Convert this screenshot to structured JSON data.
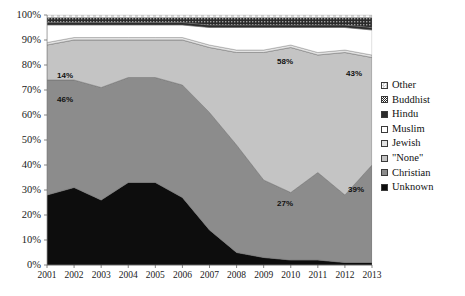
{
  "chart_data": {
    "type": "area",
    "title": "",
    "xlabel": "",
    "ylabel": "",
    "stacked": true,
    "percent": true,
    "grid": true,
    "legend_position": "right",
    "ylim": [
      0,
      100
    ],
    "yticks": [
      "0%",
      "10%",
      "20%",
      "30%",
      "40%",
      "50%",
      "60%",
      "70%",
      "80%",
      "90%",
      "100%"
    ],
    "ytick_values": [
      0,
      10,
      20,
      30,
      40,
      50,
      60,
      70,
      80,
      90,
      100
    ],
    "categories": [
      "2001",
      "2002",
      "2003",
      "2004",
      "2005",
      "2006",
      "2007",
      "2008",
      "2009",
      "2010",
      "2011",
      "2012",
      "2013"
    ],
    "series": [
      {
        "name": "Unknown",
        "color": "#0d0d0d",
        "pattern": "solid",
        "values": [
          28,
          31,
          26,
          33,
          33,
          27,
          14,
          5,
          3,
          2,
          2,
          1,
          1
        ]
      },
      {
        "name": "Christian",
        "color": "#8c8c8c",
        "pattern": "solid",
        "values": [
          46,
          43,
          45,
          42,
          42,
          45,
          47,
          43,
          31,
          27,
          35,
          27,
          39
        ]
      },
      {
        "name": "\"None\"",
        "color": "#c4c4c4",
        "pattern": "solid",
        "values": [
          14,
          16,
          19,
          15,
          15,
          18,
          26,
          37,
          51,
          58,
          47,
          57,
          43
        ]
      },
      {
        "name": "Jewish",
        "color": "#e2e2e2",
        "pattern": "solid",
        "values": [
          1,
          1,
          1,
          1,
          1,
          1,
          1,
          1,
          1,
          1,
          1,
          1,
          1
        ]
      },
      {
        "name": "Muslim",
        "color": "#ffffff",
        "pattern": "solid",
        "values": [
          7,
          5,
          5,
          5,
          5,
          5,
          7,
          9,
          9,
          7,
          10,
          9,
          10
        ]
      },
      {
        "name": "Hindu",
        "color": "#2b2b2b",
        "pattern": "solid",
        "values": [
          1,
          1,
          1,
          1,
          1,
          1,
          1,
          1,
          1,
          1,
          1,
          1,
          1
        ]
      },
      {
        "name": "Buddhist",
        "color": "#1f1f1f",
        "pattern": "dotted-dense",
        "values": [
          2,
          2,
          2,
          2,
          2,
          2,
          3,
          3,
          3,
          3,
          3,
          3,
          4
        ]
      },
      {
        "name": "Other",
        "color": "#ffffff",
        "pattern": "checker",
        "values": [
          1,
          1,
          1,
          1,
          1,
          1,
          1,
          1,
          1,
          1,
          1,
          1,
          1
        ]
      }
    ],
    "annotations": [
      {
        "text": "14%",
        "series": "\"None\"",
        "category": "2001",
        "x": 57,
        "y": 72
      },
      {
        "text": "46%",
        "series": "Christian",
        "category": "2001",
        "x": 57,
        "y": 96
      },
      {
        "text": "58%",
        "series": "\"None\"",
        "category": "2010",
        "x": 277,
        "y": 58
      },
      {
        "text": "43%",
        "series": "\"None\"",
        "category": "2013",
        "x": 346,
        "y": 70
      },
      {
        "text": "27%",
        "series": "Christian",
        "category": "2009",
        "x": 277,
        "y": 200
      },
      {
        "text": "39%",
        "series": "Christian",
        "category": "2013",
        "x": 348,
        "y": 186
      }
    ]
  },
  "legend": {
    "items": [
      {
        "label": "Other",
        "swatch": "checker",
        "color": "#ffffff"
      },
      {
        "label": "Buddhist",
        "swatch": "dotted-dense",
        "color": "#1f1f1f"
      },
      {
        "label": "Hindu",
        "swatch": "solid",
        "color": "#2b2b2b"
      },
      {
        "label": "Muslim",
        "swatch": "solid",
        "color": "#ffffff"
      },
      {
        "label": "Jewish",
        "swatch": "solid",
        "color": "#e2e2e2"
      },
      {
        "label": "\"None\"",
        "swatch": "solid",
        "color": "#c4c4c4"
      },
      {
        "label": "Christian",
        "swatch": "solid",
        "color": "#8c8c8c"
      },
      {
        "label": "Unknown",
        "swatch": "solid",
        "color": "#0d0d0d"
      }
    ]
  },
  "plot": {
    "left": 47,
    "right": 372,
    "top": 15,
    "bottom": 265
  }
}
